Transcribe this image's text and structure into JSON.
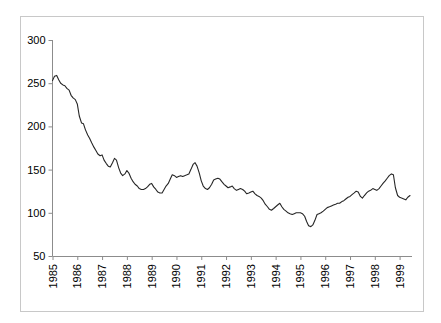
{
  "chart_data": {
    "type": "line",
    "title": "",
    "subtitle": "",
    "xlabel": "",
    "ylabel": "",
    "grid": false,
    "legend": false,
    "legend_position": "none",
    "xlim": [
      1985.0,
      1999.5
    ],
    "ylim": [
      50,
      300
    ],
    "yticks": [
      50,
      100,
      150,
      200,
      250,
      300
    ],
    "ytick_labels": [
      "50",
      "100",
      "150",
      "200",
      "250",
      "300"
    ],
    "xticks": [
      1985,
      1986,
      1987,
      1988,
      1989,
      1990,
      1991,
      1992,
      1993,
      1994,
      1995,
      1996,
      1997,
      1998,
      1999
    ],
    "xtick_labels": [
      "1985",
      "1986",
      "1987",
      "1988",
      "1989",
      "1990",
      "1991",
      "1992",
      "1993",
      "1994",
      "1995",
      "1996",
      "1997",
      "1998",
      "1999"
    ],
    "xtick_rotation": 90,
    "series": [
      {
        "name": "series-1",
        "color": "#262626",
        "x": [
          1985.0,
          1985.08,
          1985.17,
          1985.25,
          1985.33,
          1985.42,
          1985.5,
          1985.58,
          1985.67,
          1985.75,
          1985.83,
          1985.92,
          1986.0,
          1986.08,
          1986.17,
          1986.25,
          1986.33,
          1986.42,
          1986.5,
          1986.58,
          1986.67,
          1986.75,
          1986.83,
          1986.92,
          1987.0,
          1987.08,
          1987.17,
          1987.25,
          1987.33,
          1987.42,
          1987.5,
          1987.58,
          1987.67,
          1987.75,
          1987.83,
          1987.92,
          1988.0,
          1988.08,
          1988.17,
          1988.25,
          1988.33,
          1988.42,
          1988.5,
          1988.58,
          1988.67,
          1988.75,
          1988.83,
          1988.92,
          1989.0,
          1989.08,
          1989.17,
          1989.25,
          1989.33,
          1989.42,
          1989.5,
          1989.58,
          1989.67,
          1989.75,
          1989.83,
          1989.92,
          1990.0,
          1990.08,
          1990.17,
          1990.25,
          1990.33,
          1990.42,
          1990.5,
          1990.58,
          1990.67,
          1990.75,
          1990.83,
          1990.92,
          1991.0,
          1991.08,
          1991.17,
          1991.25,
          1991.33,
          1991.42,
          1991.5,
          1991.58,
          1991.67,
          1991.75,
          1991.83,
          1991.92,
          1992.0,
          1992.08,
          1992.17,
          1992.25,
          1992.33,
          1992.42,
          1992.5,
          1992.58,
          1992.67,
          1992.75,
          1992.83,
          1992.92,
          1993.0,
          1993.08,
          1993.17,
          1993.25,
          1993.33,
          1993.42,
          1993.5,
          1993.58,
          1993.67,
          1993.75,
          1993.83,
          1993.92,
          1994.0,
          1994.08,
          1994.17,
          1994.25,
          1994.33,
          1994.42,
          1994.5,
          1994.58,
          1994.67,
          1994.75,
          1994.83,
          1994.92,
          1995.0,
          1995.08,
          1995.17,
          1995.25,
          1995.33,
          1995.42,
          1995.5,
          1995.58,
          1995.67,
          1995.75,
          1995.83,
          1995.92,
          1996.0,
          1996.08,
          1996.17,
          1996.25,
          1996.33,
          1996.42,
          1996.5,
          1996.58,
          1996.67,
          1996.75,
          1996.83,
          1996.92,
          1997.0,
          1997.08,
          1997.17,
          1997.25,
          1997.33,
          1997.42,
          1997.5,
          1997.58,
          1997.67,
          1997.75,
          1997.83,
          1997.92,
          1998.0,
          1998.08,
          1998.17,
          1998.25,
          1998.33,
          1998.42,
          1998.5,
          1998.58,
          1998.67,
          1998.75,
          1998.83,
          1998.92,
          1999.0,
          1999.08,
          1999.17,
          1999.25,
          1999.33,
          1999.42
        ],
        "values": [
          253,
          258,
          259,
          254,
          250,
          248,
          247,
          244,
          242,
          236,
          233,
          231,
          226,
          212,
          204,
          203,
          196,
          190,
          186,
          181,
          176,
          172,
          168,
          166,
          167,
          161,
          157,
          154,
          153,
          158,
          163,
          161,
          152,
          146,
          143,
          145,
          149,
          146,
          140,
          136,
          133,
          131,
          128,
          127,
          127,
          128,
          130,
          133,
          134,
          130,
          127,
          124,
          123,
          123,
          127,
          131,
          134,
          139,
          144,
          143,
          141,
          142,
          143,
          142,
          143,
          144,
          145,
          150,
          156,
          158,
          154,
          146,
          137,
          131,
          128,
          127,
          129,
          133,
          138,
          139,
          140,
          139,
          136,
          133,
          131,
          129,
          130,
          131,
          128,
          126,
          127,
          128,
          127,
          125,
          122,
          123,
          124,
          125,
          122,
          120,
          119,
          117,
          114,
          110,
          107,
          104,
          103,
          105,
          107,
          109,
          111,
          107,
          104,
          102,
          100,
          99,
          98,
          99,
          100,
          100,
          100,
          99,
          96,
          90,
          85,
          84,
          86,
          91,
          98,
          99,
          100,
          102,
          104,
          106,
          107,
          108,
          109,
          110,
          111,
          111,
          113,
          114,
          116,
          118,
          119,
          121,
          123,
          125,
          124,
          119,
          117,
          120,
          123,
          125,
          126,
          128,
          127,
          126,
          128,
          131,
          134,
          137,
          140,
          143,
          145,
          144,
          129,
          120,
          118,
          117,
          116,
          115,
          118,
          120
        ]
      }
    ]
  }
}
